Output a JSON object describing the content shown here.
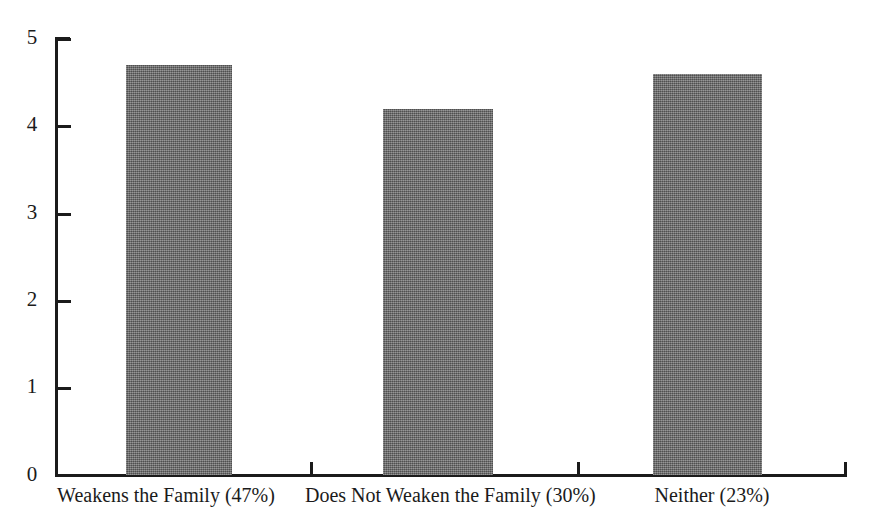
{
  "chart_data": {
    "type": "bar",
    "title": "",
    "subtitle": "",
    "xlabel": "",
    "ylabel": "",
    "categories": [
      "Weakens the Family (47%)",
      "Does Not Weaken the Family (30%)",
      "Neither (23%)"
    ],
    "values": [
      4.7,
      4.2,
      4.6
    ],
    "ylim": [
      0,
      5
    ],
    "yticks": [
      "0",
      "1",
      "2",
      "3",
      "4",
      "5"
    ],
    "grid": false,
    "legend": null,
    "bar_color": "#6e6e6e",
    "axis_color": "#1b1b1b"
  },
  "axes": {
    "y_tick_labels": [
      "5",
      "4",
      "3",
      "2",
      "1",
      "0"
    ]
  },
  "bars": [
    {
      "label": "Weakens the Family (47%)",
      "value": 4.7,
      "percent": "47%"
    },
    {
      "label": "Does Not Weaken the Family (30%)",
      "value": 4.2,
      "percent": "30%"
    },
    {
      "label": "Neither (23%)",
      "value": 4.6,
      "percent": "23%"
    }
  ]
}
